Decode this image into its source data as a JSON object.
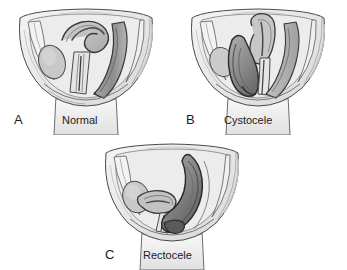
{
  "figure": {
    "background_color": "#ffffff",
    "ink_color": "#1b1b1b",
    "view": "sagittal-section",
    "panel_count": 3
  },
  "palette": {
    "outline": "#3a3a3a",
    "body_light": "#f2f2f2",
    "body_mid": "#e2e2e2",
    "tissue_light": "#dcdcdc",
    "tissue_mid": "#c4c4c4",
    "tissue_dark": "#a8a8a8",
    "organ_dark": "#8f8f8f",
    "organ_darkest": "#6f6f6f",
    "highlight": "#fafafa"
  },
  "panels": [
    {
      "id": "a",
      "letter": "A",
      "caption": "Normal",
      "description": "Normal pelvic anatomy with bladder, uterus, vagina and rectum in usual position",
      "structures": [
        {
          "name": "bladder",
          "tone": "tissue_mid"
        },
        {
          "name": "uterus",
          "tone": "tissue_dark"
        },
        {
          "name": "vagina",
          "tone": "tissue_light"
        },
        {
          "name": "rectum",
          "tone": "organ_dark"
        },
        {
          "name": "pubic-bone",
          "tone": "body_light"
        },
        {
          "name": "sacrum",
          "tone": "body_mid"
        }
      ]
    },
    {
      "id": "b",
      "letter": "B",
      "caption": "Cystocele",
      "description": "Bladder descends and bulges into the anterior vaginal wall",
      "structures": [
        {
          "name": "bladder-prolapsed",
          "tone": "organ_dark"
        },
        {
          "name": "uterus",
          "tone": "tissue_dark"
        },
        {
          "name": "vagina",
          "tone": "tissue_light"
        },
        {
          "name": "rectum",
          "tone": "tissue_mid"
        },
        {
          "name": "pubic-bone",
          "tone": "body_light"
        },
        {
          "name": "sacrum",
          "tone": "body_mid"
        }
      ]
    },
    {
      "id": "c",
      "letter": "C",
      "caption": "Rectocele",
      "description": "Rectum bulges forward into the posterior vaginal wall",
      "structures": [
        {
          "name": "bladder",
          "tone": "tissue_mid"
        },
        {
          "name": "uterus",
          "tone": "tissue_dark"
        },
        {
          "name": "vagina",
          "tone": "tissue_light"
        },
        {
          "name": "rectum-prolapsed",
          "tone": "organ_darkest"
        },
        {
          "name": "pubic-bone",
          "tone": "body_light"
        },
        {
          "name": "sacrum",
          "tone": "body_mid"
        }
      ]
    }
  ]
}
